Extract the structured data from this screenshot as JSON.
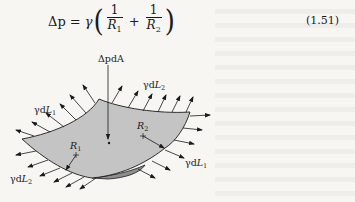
{
  "equation": {
    "lhs": "Δp",
    "equals": "=",
    "coefficient": "γ",
    "open_paren": "(",
    "close_paren": ")",
    "term1": {
      "numerator": "1",
      "denominator": "R",
      "denominator_sub": "1"
    },
    "plus": "+",
    "term2": {
      "numerator": "1",
      "denominator": "R",
      "denominator_sub": "2"
    },
    "number": "(1.51)"
  },
  "figure": {
    "labels": {
      "pressure_force": "ΔpdA",
      "tension_top": {
        "prefix": "γd",
        "var": "L",
        "sub": "2"
      },
      "tension_left": {
        "prefix": "γd",
        "var": "L",
        "sub": "1"
      },
      "tension_right": {
        "prefix": "γd",
        "var": "L",
        "sub": "1"
      },
      "tension_bottom": {
        "prefix": "γd",
        "var": "L",
        "sub": "2"
      },
      "radius1": {
        "var": "R",
        "sub": "1"
      },
      "radius2": {
        "var": "R",
        "sub": "2"
      }
    },
    "colors": {
      "surface_fill": "#c4c4c4",
      "underside_fill": "#8e8e8e",
      "ink": "#1a1a1a",
      "paper": "#f7f6f3"
    }
  }
}
